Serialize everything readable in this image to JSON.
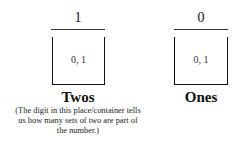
{
  "places": [
    {
      "digit": "1",
      "possible_values": "0, 1",
      "label": "Twos",
      "note": "(The digit in this place/container tells us how many sets of two are part of the number.)"
    },
    {
      "digit": "0",
      "possible_values": "0, 1",
      "label": "Ones"
    }
  ]
}
